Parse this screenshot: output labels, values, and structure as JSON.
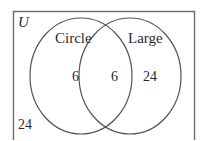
{
  "diagram": {
    "type": "venn-diagram",
    "universe_label": "U",
    "sets": [
      {
        "name": "circle-set",
        "label": "Circle"
      },
      {
        "name": "large-set",
        "label": "Large"
      }
    ],
    "regions": [
      {
        "name": "circle-only",
        "label": "6"
      },
      {
        "name": "intersection",
        "label": "6"
      },
      {
        "name": "large-only",
        "label": "24"
      },
      {
        "name": "outside-sets",
        "label": "24"
      }
    ],
    "colors": {
      "stroke": "#555555",
      "text": "#2b2b2b",
      "background": "#ffffff",
      "frame": "#6b6b6b"
    }
  }
}
